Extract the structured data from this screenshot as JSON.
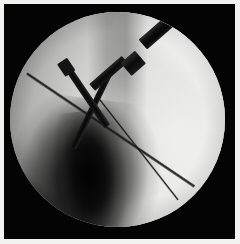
{
  "image": {
    "modality": "fluoroscopy",
    "view": "intraoperative C-arm radiograph",
    "caption": "",
    "width_px": 240,
    "height_px": 244
  },
  "frame": {
    "background_color": "#040404",
    "margin_color": "#f2f2f0",
    "margin_px": 4
  },
  "field": {
    "shape": "circle",
    "center_x_px": 117,
    "center_y_px": 123,
    "radius_px": 107,
    "base_color": "#e3e3e0",
    "rim_color": "#9d9d9a"
  },
  "anatomy": [
    {
      "name": "bone-shaft-shadow",
      "description": "dense cortical bone shaft, lower-left to centre",
      "color": "#060606",
      "angle_deg": 7
    },
    {
      "name": "soft-tissue-bright-field",
      "description": "bright soft tissue, right hemifield",
      "color": "#f4f4f2"
    },
    {
      "name": "soft-tissue-wedge-upper-right",
      "description": "bright triangular soft tissue edge, upper right",
      "color": "#fdfdfb"
    },
    {
      "name": "vertical-density-band",
      "description": "darker vertical band, upper centre",
      "color": "#3a3a3a"
    }
  ],
  "instruments": [
    {
      "name": "driver-shaft",
      "description": "thick radio-opaque driver/drill shaft entering from upper right",
      "angle_deg": -41,
      "color": "#0d0d0d"
    },
    {
      "name": "driver-collar",
      "description": "stepped collar on driver shaft",
      "angle_deg": -41,
      "color": "#0b0b0b"
    },
    {
      "name": "k-wire-a",
      "description": "K-wire running upper-left to lower-right through centre",
      "angle_deg": 56,
      "color": "#080808"
    },
    {
      "name": "k-wire-b",
      "description": "K-wire running upper-right to lower-left, crossing wire A",
      "angle_deg": 116,
      "color": "#070707"
    },
    {
      "name": "guide-wire-long",
      "description": "long thin guide wire from upper-left rim to lower-right rim",
      "angle_deg": 34,
      "color": "#101010"
    },
    {
      "name": "guide-wire-lower",
      "description": "thin guide wire from centre descending to lower-right rim",
      "angle_deg": 52,
      "color": "#0e0e0e"
    }
  ]
}
